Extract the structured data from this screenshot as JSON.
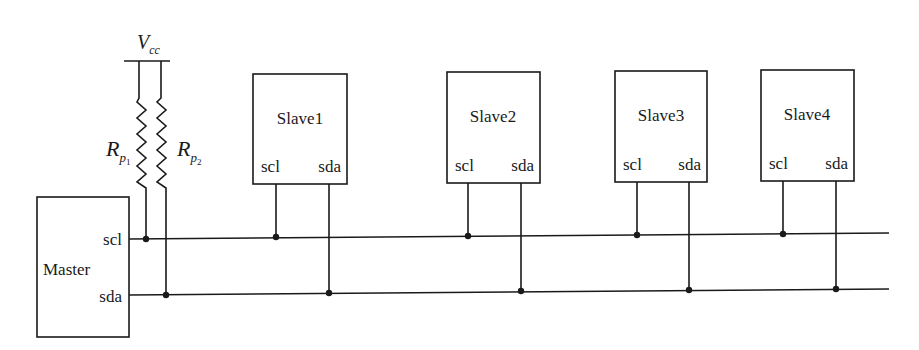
{
  "diagram": {
    "supply": {
      "label_main": "V",
      "label_sub": "cc"
    },
    "resistors": [
      {
        "label_main": "R",
        "label_sub": "p",
        "label_subsub": "1"
      },
      {
        "label_main": "R",
        "label_sub": "p",
        "label_subsub": "2"
      }
    ],
    "master": {
      "name": "Master",
      "pin_scl": "scl",
      "pin_sda": "sda"
    },
    "slaves": [
      {
        "name": "Slave1",
        "pin_scl": "scl",
        "pin_sda": "sda"
      },
      {
        "name": "Slave2",
        "pin_scl": "scl",
        "pin_sda": "sda"
      },
      {
        "name": "Slave3",
        "pin_scl": "scl",
        "pin_sda": "sda"
      },
      {
        "name": "Slave4",
        "pin_scl": "scl",
        "pin_sda": "sda"
      }
    ],
    "buses": [
      "scl",
      "sda"
    ],
    "colors": {
      "stroke": "#1a1a1a",
      "background": "#ffffff"
    }
  }
}
